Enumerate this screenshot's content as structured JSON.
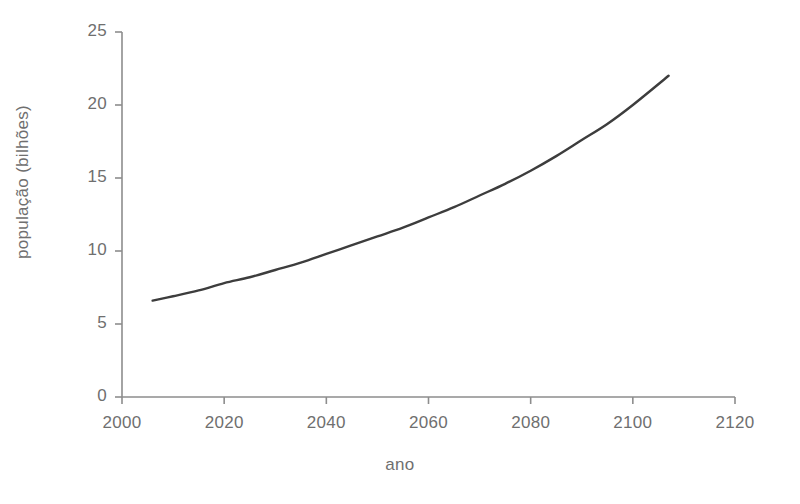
{
  "chart_data": {
    "type": "line",
    "title": "",
    "subtitle": "",
    "xlabel": "ano",
    "ylabel": "população (bilhões)",
    "xlim": [
      2000,
      2120
    ],
    "ylim": [
      0,
      25
    ],
    "xticks": [
      2000,
      2020,
      2040,
      2060,
      2080,
      2100,
      2120
    ],
    "xtick_labels": [
      "2000",
      "2020",
      "2040",
      "2060",
      "2080",
      "2100",
      "2120"
    ],
    "yticks": [
      0,
      5,
      10,
      15,
      20,
      25
    ],
    "ytick_labels": [
      "0",
      "5",
      "10",
      "15",
      "20",
      "25"
    ],
    "grid": false,
    "legend": null,
    "legend_position": "none",
    "annotations": [],
    "series": [
      {
        "name": "população mundial",
        "color": "#3d3d3d",
        "line_width": 2.4,
        "x": [
          2006,
          2010,
          2015,
          2020,
          2025,
          2030,
          2035,
          2040,
          2045,
          2050,
          2055,
          2060,
          2065,
          2070,
          2075,
          2080,
          2085,
          2090,
          2095,
          2100,
          2107
        ],
        "values": [
          6.6,
          6.9,
          7.3,
          7.8,
          8.2,
          8.7,
          9.2,
          9.8,
          10.4,
          11.0,
          11.6,
          12.3,
          13.0,
          13.8,
          14.6,
          15.5,
          16.5,
          17.6,
          18.7,
          20.0,
          22.0
        ]
      }
    ]
  },
  "axis_style": {
    "axis_color": "#8d8d8d",
    "tick_color": "#8d8d8d",
    "text_color": "#6f6f6f",
    "background": "#ffffff"
  },
  "icons": {
    "line_series": "line-series-glyph"
  }
}
